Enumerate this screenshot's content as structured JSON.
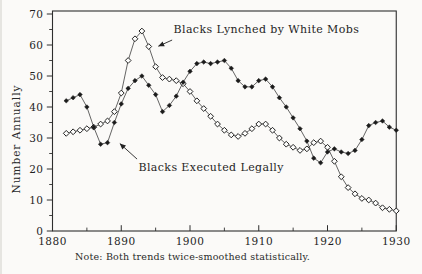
{
  "figure": {
    "note": "Note: Both trends twice-smoothed statistically."
  },
  "chart_data": {
    "type": "line",
    "title": "",
    "xlabel": "",
    "ylabel": "Number Annually",
    "xlim": [
      1880,
      1930
    ],
    "ylim": [
      0,
      70
    ],
    "grid": false,
    "legend_position": "inline-annotations",
    "x_ticks": [
      1880,
      1890,
      1900,
      1910,
      1920,
      1930
    ],
    "x_minor_ticks": [
      1885,
      1895,
      1905,
      1915,
      1925
    ],
    "y_ticks": [
      0,
      10,
      20,
      30,
      40,
      50,
      60,
      70
    ],
    "y_minor_ticks": [
      5,
      15,
      25,
      35,
      45,
      55,
      65
    ],
    "x": [
      1882,
      1883,
      1884,
      1885,
      1886,
      1887,
      1888,
      1889,
      1890,
      1891,
      1892,
      1893,
      1894,
      1895,
      1896,
      1897,
      1898,
      1899,
      1900,
      1901,
      1902,
      1903,
      1904,
      1905,
      1906,
      1907,
      1908,
      1909,
      1910,
      1911,
      1912,
      1913,
      1914,
      1915,
      1916,
      1917,
      1918,
      1919,
      1920,
      1921,
      1922,
      1923,
      1924,
      1925,
      1926,
      1927,
      1928,
      1929,
      1930
    ],
    "series": [
      {
        "name": "Blacks Lynched by White Mobs",
        "marker": "open-diamond",
        "values": [
          31.5,
          32,
          32.5,
          33,
          33.5,
          34.5,
          35.5,
          38.5,
          44.5,
          55,
          62,
          64.5,
          59.5,
          53,
          49.5,
          49,
          48.5,
          47.5,
          45,
          42,
          39.5,
          37,
          34.5,
          32.5,
          31,
          30.5,
          31.5,
          33,
          34.5,
          34.5,
          32.5,
          30,
          28,
          27,
          26,
          26.5,
          28.5,
          29,
          27,
          22.5,
          17.5,
          14,
          12,
          10.5,
          10,
          9,
          7.5,
          7,
          6.5
        ]
      },
      {
        "name": "Blacks Executed Legally",
        "marker": "filled-diamond",
        "values": [
          42,
          43,
          44,
          40,
          33.5,
          28,
          28.5,
          35,
          41,
          46,
          48.5,
          50,
          47,
          44,
          38.5,
          40.5,
          43.5,
          48,
          51.5,
          54,
          54.5,
          54,
          54.5,
          55,
          52.5,
          48.5,
          46.5,
          46.5,
          48.5,
          49,
          46.5,
          43,
          40,
          36.5,
          33,
          29,
          23.5,
          22,
          25.5,
          26.5,
          25.5,
          25,
          26,
          29.5,
          34,
          35,
          35.5,
          33.5,
          32.5
        ]
      }
    ],
    "annotations": [
      {
        "text": "Blacks Lynched by White Mobs",
        "target_series": "Blacks Lynched by White Mobs",
        "text_x": 1897.6,
        "text_y": 65.3,
        "arrow_from_x": 1897.4,
        "arrow_from_y": 61.6,
        "arrow_to_x": 1895.4,
        "arrow_to_y": 59.6
      },
      {
        "text": "Blacks Executed Legally",
        "target_series": "Blacks Executed Legally",
        "text_x": 1892.5,
        "text_y": 20.6,
        "arrow_from_x": 1892.3,
        "arrow_from_y": 23.2,
        "arrow_to_x": 1889.8,
        "arrow_to_y": 28.2
      }
    ],
    "colors": {
      "ink": "#232323",
      "line": "#3d3d3d",
      "background": "#fbfaf8"
    }
  }
}
